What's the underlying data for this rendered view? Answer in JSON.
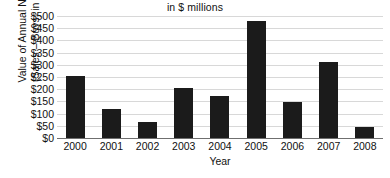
{
  "chart_data": {
    "type": "bar",
    "title": "in $ millions",
    "xlabel": "Year",
    "ylabel_lines": [
      "Value of Annual Net Trades",
      "(Sales – Buys) in $ millions"
    ],
    "ylabel": "Value of Annual Net Trades (Sales – Buys) in $ millions",
    "categories": [
      "2000",
      "2001",
      "2002",
      "2003",
      "2004",
      "2005",
      "2006",
      "2007",
      "2008"
    ],
    "values": [
      255,
      120,
      65,
      205,
      172,
      478,
      148,
      313,
      45
    ],
    "ylim": [
      0,
      500
    ],
    "yticks": [
      0,
      50,
      100,
      150,
      200,
      250,
      300,
      350,
      400,
      450,
      500
    ],
    "ytick_labels": [
      "$0",
      "$50",
      "$100",
      "$150",
      "$200",
      "$250",
      "$300",
      "$350",
      "$400",
      "$450",
      "$500"
    ],
    "grid": true,
    "legend": null,
    "bar_color": "#1b1b1b",
    "grid_color": "#d8d8d8",
    "axis_color": "#6f6f6f",
    "background": "#ffffff"
  }
}
